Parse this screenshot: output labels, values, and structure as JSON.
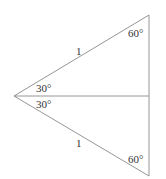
{
  "diagram": {
    "line_color": "#8a8a8a",
    "text_color": "#333333",
    "vertices": {
      "apex": [
        14,
        96
      ],
      "top": [
        149,
        15
      ],
      "middle": [
        149,
        96
      ],
      "bottom": [
        149,
        176
      ]
    },
    "labels": {
      "top_hypotenuse": "1",
      "bottom_hypotenuse": "1",
      "top_left_angle": "30°",
      "bottom_left_angle": "30°",
      "top_right_angle": "60°",
      "bottom_right_angle": "60°"
    }
  }
}
